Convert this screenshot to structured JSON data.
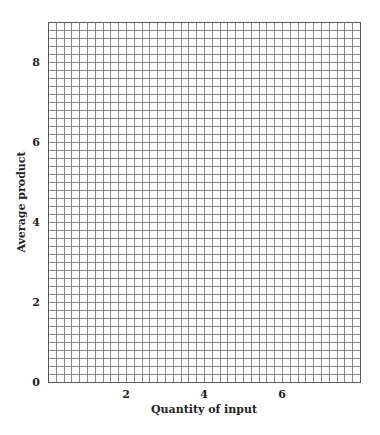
{
  "chart_data": {
    "type": "line",
    "title": "",
    "xlabel": "Quantity of input",
    "ylabel": "Average product",
    "xlim": [
      0,
      8
    ],
    "ylim": [
      0,
      9
    ],
    "x_ticks": [
      2,
      4,
      6
    ],
    "y_ticks": [
      0,
      2,
      4,
      6,
      8
    ],
    "grid": true,
    "grid_step_x": 0.2,
    "grid_step_y": 0.2,
    "series": [],
    "colors": {
      "grid": "#6a6a6a",
      "text": "#222222",
      "background": "#ffffff"
    }
  }
}
